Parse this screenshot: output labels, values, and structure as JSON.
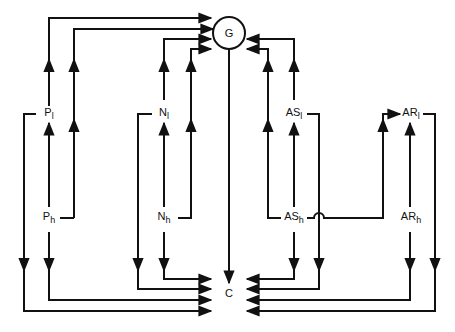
{
  "diagram": {
    "nodes": {
      "G": {
        "label": "G",
        "shape": "circle"
      },
      "C": {
        "label": "C"
      },
      "P_l": {
        "base": "P",
        "sub": "l"
      },
      "P_h": {
        "base": "P",
        "sub": "h"
      },
      "N_l": {
        "base": "N",
        "sub": "l"
      },
      "N_h": {
        "base": "N",
        "sub": "h"
      },
      "AS_l": {
        "base": "AS",
        "sub": "l"
      },
      "AS_h": {
        "base": "AS",
        "sub": "h"
      },
      "AR_l": {
        "base": "AR",
        "sub": "l"
      },
      "AR_h": {
        "base": "AR",
        "sub": "h"
      }
    },
    "edges": [
      [
        "P_l",
        "G"
      ],
      [
        "P_h",
        "G"
      ],
      [
        "N_l",
        "G"
      ],
      [
        "N_h",
        "G"
      ],
      [
        "AS_l",
        "G"
      ],
      [
        "AS_h",
        "G"
      ],
      [
        "G",
        "C"
      ],
      [
        "P_l",
        "C"
      ],
      [
        "P_h",
        "C"
      ],
      [
        "N_l",
        "C"
      ],
      [
        "N_h",
        "C"
      ],
      [
        "AS_l",
        "C"
      ],
      [
        "AS_h",
        "C"
      ],
      [
        "AR_l",
        "C"
      ],
      [
        "AR_h",
        "C"
      ],
      [
        "P_h",
        "P_l"
      ],
      [
        "N_h",
        "N_l"
      ],
      [
        "AS_h",
        "AS_l"
      ],
      [
        "AR_h",
        "AR_l"
      ],
      [
        "AS_h",
        "AR_l"
      ]
    ],
    "stroke_color": "#111111"
  }
}
